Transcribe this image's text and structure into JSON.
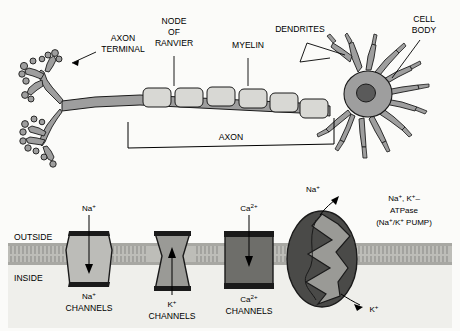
{
  "figure": {
    "panels": [
      "neuron-anatomy",
      "membrane-channels"
    ]
  },
  "colors": {
    "outline": "#1a1a1a",
    "neuron_fill": "#9e9e9e",
    "myelin_fill": "#d8d8d4",
    "nucleus_fill": "#5a5a5a",
    "membrane_fill": "#bdbdb8",
    "background": "#fbfbf9",
    "na_channel_fill": "#bcbcb8",
    "k_channel_fill": "#9a9a96",
    "ca_channel_fill": "#6e6e6a",
    "pump_fill": "#4a4a48",
    "pump_channel_fill": "#9a9a96",
    "panel_bg": "#efefeb"
  },
  "neuron": {
    "labels": {
      "axon_terminal": "AXON\nTERMINAL",
      "axon_terminal_line1": "AXON",
      "axon_terminal_line2": "TERMINAL",
      "node_of_ranvier_line1": "NODE",
      "node_of_ranvier_line2": "OF",
      "node_of_ranvier_line3": "RANVIER",
      "myelin": "MYELIN",
      "dendrites": "DENDRITES",
      "cell_body_line1": "CELL",
      "cell_body_line2": "BODY",
      "axon": "AXON"
    },
    "myelin_segment_count": 6
  },
  "membrane": {
    "labels": {
      "outside": "OUTSIDE",
      "inside": "INSIDE"
    },
    "channels": [
      {
        "id": "sodium-channel",
        "ion_top": "Na",
        "ion_top_charge": "+",
        "name_line1": "Na",
        "name_charge": "+",
        "name_line2": "CHANNELS",
        "arrow_direction": "down",
        "shape": "barrel"
      },
      {
        "id": "potassium-channel",
        "ion_top": "",
        "ion_top_charge": "",
        "name_line1": "K",
        "name_charge": "+",
        "name_line2": "CHANNELS",
        "arrow_direction": "up",
        "shape": "hourglass"
      },
      {
        "id": "calcium-channel",
        "ion_top": "Ca",
        "ion_top_charge": "2+",
        "name_line1": "Ca",
        "name_charge": "2+",
        "name_line2": "CHANNELS",
        "arrow_direction": "down",
        "shape": "rectangle"
      }
    ],
    "pump": {
      "id": "na-k-atpase-pump",
      "label_line1_a": "Na",
      "label_line1_b": ", K",
      "label_line1_c": "–",
      "label_line2": "ATPase",
      "label_line3_a": "(Na",
      "label_line3_b": "/K",
      "label_line3_c": " PUMP)",
      "ion_out": "Na",
      "ion_out_charge": "+",
      "ion_in": "K",
      "ion_in_charge": "+"
    }
  }
}
